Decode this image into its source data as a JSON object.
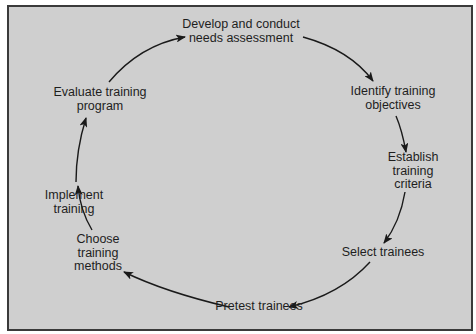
{
  "diagram": {
    "type": "cycle",
    "colors": {
      "background": "#cfcfcf",
      "border": "#3a3a3a",
      "text": "#1e1e1e",
      "arrow": "#1a1a1a"
    },
    "steps": [
      {
        "id": "develop",
        "lines": [
          "Develop and conduct",
          "needs assessment"
        ]
      },
      {
        "id": "identify",
        "lines": [
          "Identify training",
          "objectives"
        ]
      },
      {
        "id": "establish",
        "lines": [
          "Establish",
          "training",
          "criteria"
        ]
      },
      {
        "id": "select",
        "lines": [
          "Select trainees"
        ]
      },
      {
        "id": "pretest",
        "lines": [
          "Pretest trainees"
        ]
      },
      {
        "id": "choose",
        "lines": [
          "Choose",
          "training",
          "methods"
        ]
      },
      {
        "id": "implement",
        "lines": [
          "Implement",
          "training"
        ]
      },
      {
        "id": "evaluate",
        "lines": [
          "Evaluate training",
          "program"
        ]
      }
    ],
    "edges": [
      [
        "develop",
        "identify"
      ],
      [
        "identify",
        "establish"
      ],
      [
        "establish",
        "select"
      ],
      [
        "select",
        "pretest"
      ],
      [
        "pretest",
        "choose"
      ],
      [
        "choose",
        "implement"
      ],
      [
        "implement",
        "evaluate"
      ],
      [
        "evaluate",
        "develop"
      ]
    ]
  }
}
